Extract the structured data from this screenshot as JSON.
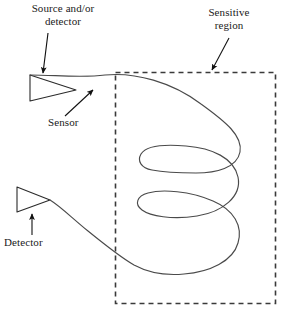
{
  "figure": {
    "background_color": "#ffffff",
    "stroke_color": "#1a1a1a",
    "width": 283,
    "height": 319
  },
  "labels": {
    "source_detector": "Source and/or\ndetector",
    "sensitive_region": "Sensitive\nregion",
    "sensor": "Sensor",
    "detector": "Detector"
  },
  "annotations": [
    {
      "name": "source-detector-pointer",
      "label": "Source and/or detector",
      "points_to": "upper-coupler-triangle"
    },
    {
      "name": "sensitive-region-pointer",
      "label": "Sensitive region",
      "points_to": "dashed-boundary-box"
    },
    {
      "name": "sensor-pointer",
      "label": "Sensor",
      "points_to": "waveguide-core"
    },
    {
      "name": "detector-pointer",
      "label": "Detector",
      "points_to": "lower-coupler-triangle"
    }
  ],
  "elements": {
    "upper_coupler": {
      "name": "upper-coupler-triangle",
      "shape": "triangle",
      "orientation": "points-right",
      "role": "source and/or detector prism coupler"
    },
    "lower_coupler": {
      "name": "lower-coupler-triangle",
      "shape": "triangle",
      "orientation": "points-right",
      "role": "detector prism coupler"
    },
    "sensitive_region": {
      "name": "dashed-boundary-box",
      "shape": "rectangle",
      "line_style": "dashed",
      "role": "sensitive region boundary"
    },
    "waveguide": {
      "name": "waveguide-core",
      "shape": "serpentine",
      "role": "optical waveguide routed through sensitive region",
      "turns": 3
    }
  }
}
